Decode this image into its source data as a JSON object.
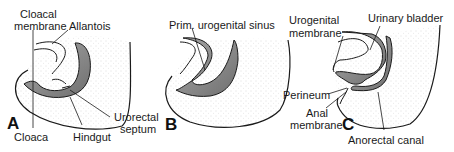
{
  "panels": [
    {
      "letter": "A",
      "labels": {
        "cloacal_membrane_1": "Cloacal",
        "cloacal_membrane_2": "membrane",
        "allantois": "Allantois",
        "cloaca": "Cloaca",
        "hindgut": "Hindgut",
        "urorectal_septum_1": "Urorectal",
        "urorectal_septum_2": "septum"
      }
    },
    {
      "letter": "B",
      "labels": {
        "prim_urogenital_sinus": "Prim. urogenital sinus"
      }
    },
    {
      "letter": "C",
      "labels": {
        "urogenital_membrane_1": "Urogenital",
        "urogenital_membrane_2": "membrane",
        "urinary_bladder": "Urinary bladder",
        "perineum": "Perineum",
        "anal_membrane_1": "Anal",
        "anal_membrane_2": "membrane",
        "anorectal_canal": "Anorectal canal"
      }
    }
  ],
  "colors": {
    "tissue_fill": "#8a8a8a",
    "outline": "#1a1a1a",
    "stipple": "#bdbdbd"
  }
}
